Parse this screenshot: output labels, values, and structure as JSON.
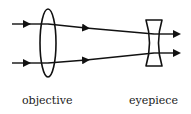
{
  "diagram": {
    "type": "telescope-ray-diagram",
    "labels": {
      "objective": "objective",
      "eyepiece": "eyepiece"
    },
    "elements": [
      {
        "name": "objective",
        "kind": "convex-lens"
      },
      {
        "name": "eyepiece",
        "kind": "concave-lens"
      }
    ],
    "rays": 2,
    "colors": {
      "stroke": "#111111",
      "background": "#ffffff"
    }
  }
}
